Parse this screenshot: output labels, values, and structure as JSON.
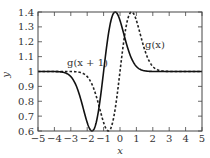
{
  "chart_data": {
    "type": "line",
    "title": "",
    "xlabel": "x",
    "ylabel": "y",
    "xlim": [
      -5,
      5
    ],
    "ylim": [
      0.6,
      1.4
    ],
    "xticks": [
      "−5",
      "−4",
      "−3",
      "−2",
      "−1",
      "0",
      "1",
      "2",
      "3",
      "4",
      "5"
    ],
    "yticks": [
      "0.6",
      "0.7",
      "0.8",
      "0.9",
      "1",
      "1.1",
      "1.2",
      "1.3",
      "1.4"
    ],
    "grid": false,
    "series": [
      {
        "name": "g(x + 1)",
        "style": "solid",
        "min": {
          "x": -1.7,
          "y": 0.6
        },
        "max": {
          "x": -0.3,
          "y": 1.4
        },
        "baseline": 1.0
      },
      {
        "name": "g(x)",
        "style": "dashed",
        "min": {
          "x": -0.7,
          "y": 0.6
        },
        "max": {
          "x": 0.7,
          "y": 1.4
        },
        "baseline": 1.0
      }
    ],
    "annotations": [
      {
        "text": "g(x + 1)",
        "x": -2.3,
        "y": 1.1
      },
      {
        "text": "g(x)",
        "x": 1.8,
        "y": 1.18
      }
    ]
  },
  "labels": {
    "x": "x",
    "y": "y",
    "annot_shift": "g(x + 1)",
    "annot_orig": "g(x)"
  }
}
